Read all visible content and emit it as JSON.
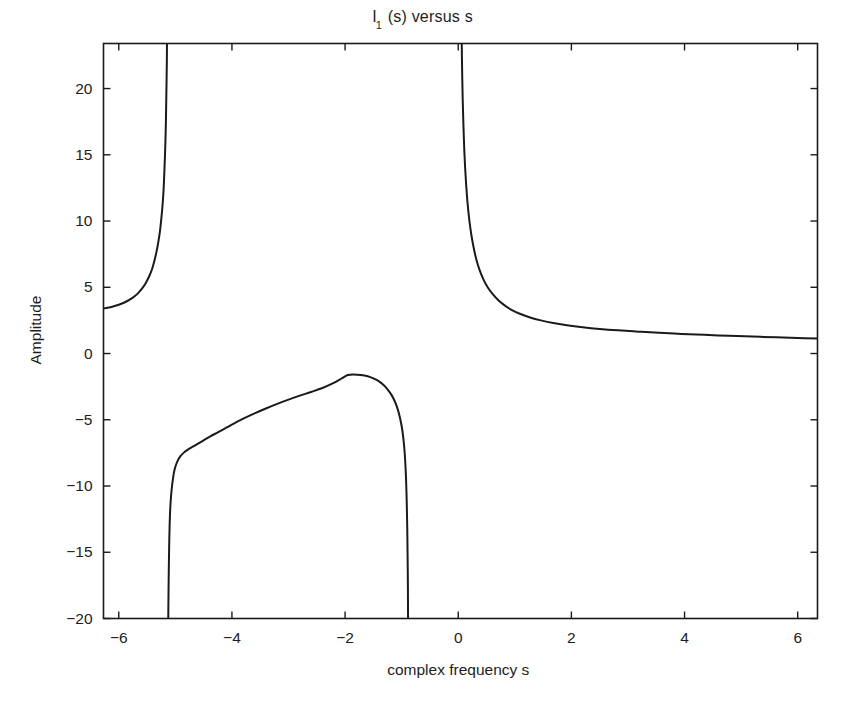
{
  "chart_data": {
    "type": "line",
    "title_main": "I",
    "title_sub": "1",
    "title_rest": " (s) versus s",
    "xlabel": "complex frequency s",
    "ylabel": "Amplitude",
    "xlim": [
      -6.27,
      6.35
    ],
    "ylim": [
      -20,
      23.4
    ],
    "xticks": [
      -6,
      -4,
      -2,
      0,
      2,
      4,
      6
    ],
    "xticklabels": [
      "-6",
      "-4",
      "-2",
      "0",
      "2",
      "4",
      "6"
    ],
    "yticks": [
      20,
      15,
      10,
      5,
      0,
      -5,
      -10,
      -15,
      -20
    ],
    "yticklabels": [
      "20",
      "15",
      "10",
      "5",
      "0",
      "-5",
      "-10",
      "-15",
      "-20"
    ],
    "grid": false,
    "legend": null,
    "line_color": "#1a1a1a",
    "line_width": 2.0,
    "asymptotes": [
      -5.2,
      -5.12,
      -0.9,
      0.05
    ],
    "series": [
      {
        "name": "branch-left",
        "comment": "left branch: rises from y~3.4 at left edge to +infinity near s=-5.2",
        "points": [
          [
            -6.27,
            3.4
          ],
          [
            -6.2,
            3.45
          ],
          [
            -6.1,
            3.55
          ],
          [
            -6.0,
            3.68
          ],
          [
            -5.9,
            3.85
          ],
          [
            -5.8,
            4.08
          ],
          [
            -5.72,
            4.32
          ],
          [
            -5.65,
            4.6
          ],
          [
            -5.58,
            4.95
          ],
          [
            -5.52,
            5.35
          ],
          [
            -5.46,
            5.85
          ],
          [
            -5.41,
            6.4
          ],
          [
            -5.37,
            7.0
          ],
          [
            -5.33,
            7.75
          ],
          [
            -5.3,
            8.45
          ],
          [
            -5.27,
            9.3
          ],
          [
            -5.25,
            10.1
          ],
          [
            -5.23,
            11.0
          ],
          [
            -5.21,
            12.2
          ],
          [
            -5.2,
            13.1
          ],
          [
            -5.19,
            14.2
          ],
          [
            -5.18,
            15.4
          ],
          [
            -5.17,
            16.9
          ],
          [
            -5.165,
            18.0
          ],
          [
            -5.16,
            19.3
          ],
          [
            -5.155,
            20.7
          ],
          [
            -5.15,
            22.2
          ],
          [
            -5.148,
            23.4
          ]
        ]
      },
      {
        "name": "branch-middle",
        "comment": "middle branch: arc peaking near y=-1.6 at s=-1.95, dropping to -20 at both ends",
        "points": [
          [
            -5.125,
            -20.0
          ],
          [
            -5.122,
            -18.5
          ],
          [
            -5.118,
            -17.0
          ],
          [
            -5.113,
            -15.5
          ],
          [
            -5.107,
            -14.0
          ],
          [
            -5.1,
            -12.8
          ],
          [
            -5.09,
            -11.7
          ],
          [
            -5.075,
            -10.7
          ],
          [
            -5.055,
            -9.85
          ],
          [
            -5.03,
            -9.1
          ],
          [
            -5.0,
            -8.55
          ],
          [
            -4.96,
            -8.1
          ],
          [
            -4.91,
            -7.75
          ],
          [
            -4.85,
            -7.48
          ],
          [
            -4.78,
            -7.25
          ],
          [
            -4.7,
            -7.05
          ],
          [
            -4.6,
            -6.8
          ],
          [
            -4.5,
            -6.55
          ],
          [
            -4.38,
            -6.25
          ],
          [
            -4.25,
            -5.95
          ],
          [
            -4.1,
            -5.6
          ],
          [
            -3.95,
            -5.25
          ],
          [
            -3.8,
            -4.92
          ],
          [
            -3.6,
            -4.52
          ],
          [
            -3.4,
            -4.15
          ],
          [
            -3.2,
            -3.8
          ],
          [
            -3.0,
            -3.48
          ],
          [
            -2.8,
            -3.18
          ],
          [
            -2.6,
            -2.9
          ],
          [
            -2.4,
            -2.6
          ],
          [
            -2.2,
            -2.22
          ],
          [
            -2.05,
            -1.85
          ],
          [
            -1.95,
            -1.62
          ],
          [
            -1.85,
            -1.58
          ],
          [
            -1.72,
            -1.62
          ],
          [
            -1.6,
            -1.72
          ],
          [
            -1.5,
            -1.88
          ],
          [
            -1.4,
            -2.1
          ],
          [
            -1.32,
            -2.38
          ],
          [
            -1.25,
            -2.7
          ],
          [
            -1.18,
            -3.12
          ],
          [
            -1.12,
            -3.62
          ],
          [
            -1.07,
            -4.2
          ],
          [
            -1.03,
            -4.85
          ],
          [
            -0.995,
            -5.6
          ],
          [
            -0.97,
            -6.4
          ],
          [
            -0.95,
            -7.3
          ],
          [
            -0.935,
            -8.3
          ],
          [
            -0.923,
            -9.4
          ],
          [
            -0.914,
            -10.6
          ],
          [
            -0.907,
            -11.9
          ],
          [
            -0.901,
            -13.2
          ],
          [
            -0.897,
            -14.6
          ],
          [
            -0.893,
            -16.0
          ],
          [
            -0.89,
            -17.5
          ],
          [
            -0.888,
            -19.0
          ],
          [
            -0.887,
            -20.0
          ]
        ]
      },
      {
        "name": "branch-right",
        "comment": "right branch: falls from +infinity near s=0.05 and decays toward y~1 at right edge",
        "points": [
          [
            0.062,
            23.4
          ],
          [
            0.07,
            21.0
          ],
          [
            0.08,
            19.0
          ],
          [
            0.092,
            17.2
          ],
          [
            0.105,
            15.6
          ],
          [
            0.122,
            14.0
          ],
          [
            0.142,
            12.6
          ],
          [
            0.166,
            11.3
          ],
          [
            0.195,
            10.1
          ],
          [
            0.23,
            9.0
          ],
          [
            0.272,
            8.0
          ],
          [
            0.32,
            7.1
          ],
          [
            0.378,
            6.3
          ],
          [
            0.445,
            5.6
          ],
          [
            0.52,
            5.0
          ],
          [
            0.61,
            4.48
          ],
          [
            0.71,
            4.02
          ],
          [
            0.82,
            3.63
          ],
          [
            0.95,
            3.28
          ],
          [
            1.1,
            2.98
          ],
          [
            1.27,
            2.72
          ],
          [
            1.46,
            2.5
          ],
          [
            1.68,
            2.3
          ],
          [
            1.92,
            2.14
          ],
          [
            2.2,
            1.99
          ],
          [
            2.5,
            1.86
          ],
          [
            2.82,
            1.75
          ],
          [
            3.18,
            1.65
          ],
          [
            3.55,
            1.56
          ],
          [
            3.95,
            1.48
          ],
          [
            4.35,
            1.41
          ],
          [
            4.78,
            1.34
          ],
          [
            5.2,
            1.28
          ],
          [
            5.62,
            1.22
          ],
          [
            6.0,
            1.17
          ],
          [
            6.35,
            1.13
          ]
        ]
      }
    ]
  },
  "axes": {
    "frame_color": "#1a1a1a"
  }
}
